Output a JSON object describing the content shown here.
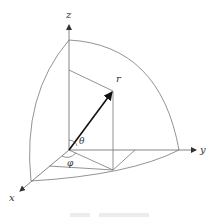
{
  "diagram": {
    "type": "spherical-coordinates",
    "axes": {
      "x_label": "x",
      "y_label": "y",
      "z_label": "z"
    },
    "point_label": "r",
    "angles": {
      "polar_label": "θ",
      "azimuth_label": "φ"
    },
    "colors": {
      "line": "#6b6b6b",
      "vector": "#222222",
      "axis": "#555555",
      "label": "#333333"
    }
  }
}
